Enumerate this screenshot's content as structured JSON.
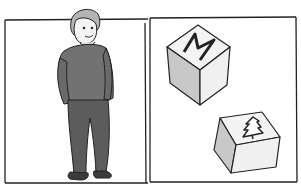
{
  "illustration": {
    "caption": "Boy standing in left panel; two cubes in right panel",
    "left_panel": {
      "subject": "boy",
      "description": "A boy in a dark sweater and trousers, hands in pockets, smiling"
    },
    "right_panel": {
      "objects": [
        {
          "name": "cube-1",
          "symbol": "M"
        },
        {
          "name": "cube-2",
          "symbol": "tree"
        }
      ]
    },
    "colors": {
      "background": "#ffffff",
      "line": "#222222",
      "clothing": "#6e6e6e",
      "trousers": "#5a5a5a",
      "hair": "#b0b0b0",
      "cube_shade": "#c9c9c9",
      "cube_light": "#f2f2f2"
    }
  }
}
